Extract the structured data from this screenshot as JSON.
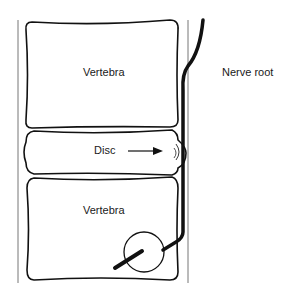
{
  "labels": {
    "top_vertebra": "Vertebra",
    "nerve_root": "Nerve root",
    "disc": "Disc",
    "bottom_vertebra": "Vertebra"
  },
  "colors": {
    "stroke": "#111111",
    "guide_line": "#777777",
    "background": "#ffffff"
  }
}
